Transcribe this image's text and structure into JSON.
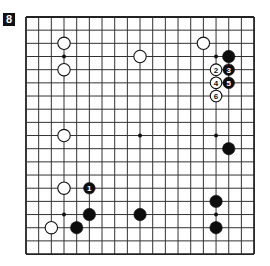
{
  "diagram": {
    "label": "8",
    "board": {
      "size": 19,
      "origin_x": 26,
      "origin_y": 17,
      "spacing_x": 12.67,
      "spacing_y": 13.17,
      "line_color": "#333333",
      "border_color": "#222222"
    },
    "star_points": [
      {
        "col": 3,
        "row": 3
      },
      {
        "col": 9,
        "row": 3
      },
      {
        "col": 15,
        "row": 3
      },
      {
        "col": 3,
        "row": 9
      },
      {
        "col": 9,
        "row": 9
      },
      {
        "col": 15,
        "row": 9
      },
      {
        "col": 3,
        "row": 15
      },
      {
        "col": 9,
        "row": 15
      },
      {
        "col": 15,
        "row": 15
      }
    ],
    "stones": [
      {
        "color": "white",
        "col": 3,
        "row": 2,
        "label": ""
      },
      {
        "color": "white",
        "col": 3,
        "row": 4,
        "label": ""
      },
      {
        "color": "white",
        "col": 9,
        "row": 3,
        "label": ""
      },
      {
        "color": "white",
        "col": 14,
        "row": 2,
        "label": ""
      },
      {
        "color": "black",
        "col": 16,
        "row": 3,
        "label": ""
      },
      {
        "color": "white",
        "col": 15,
        "row": 4,
        "label": "2"
      },
      {
        "color": "black",
        "col": 16,
        "row": 4,
        "label": "3"
      },
      {
        "color": "white",
        "col": 15,
        "row": 5,
        "label": "4"
      },
      {
        "color": "black",
        "col": 16,
        "row": 5,
        "label": "5"
      },
      {
        "color": "white",
        "col": 15,
        "row": 6,
        "label": "6"
      },
      {
        "color": "white",
        "col": 3,
        "row": 9,
        "label": ""
      },
      {
        "color": "black",
        "col": 16,
        "row": 10,
        "label": ""
      },
      {
        "color": "white",
        "col": 3,
        "row": 13,
        "label": ""
      },
      {
        "color": "black",
        "col": 5,
        "row": 13,
        "label": "1"
      },
      {
        "color": "black",
        "col": 15,
        "row": 14,
        "label": ""
      },
      {
        "color": "black",
        "col": 5,
        "row": 15,
        "label": ""
      },
      {
        "color": "black",
        "col": 9,
        "row": 15,
        "label": ""
      },
      {
        "color": "white",
        "col": 2,
        "row": 16,
        "label": ""
      },
      {
        "color": "black",
        "col": 4,
        "row": 16,
        "label": ""
      },
      {
        "color": "black",
        "col": 15,
        "row": 16,
        "label": ""
      }
    ]
  }
}
